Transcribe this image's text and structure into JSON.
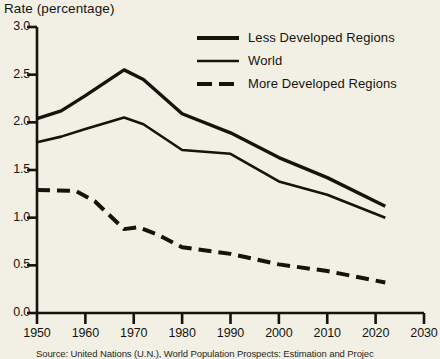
{
  "chart_data": {
    "type": "line",
    "title": "Rate (percentage)",
    "xlabel": "",
    "ylabel": "Rate (percentage)",
    "xlim": [
      1950,
      2030
    ],
    "ylim": [
      0.0,
      3.0
    ],
    "xticks": [
      1950,
      1960,
      1970,
      1980,
      1990,
      2000,
      2010,
      2020,
      2030
    ],
    "yticks": [
      0.0,
      0.5,
      1.0,
      1.5,
      2.0,
      2.5,
      3.0
    ],
    "ytick_labels": [
      "0.0",
      "0.5",
      "1.0",
      "1.5",
      "2.0",
      "2.5",
      "3.0"
    ],
    "xtick_labels": [
      "1950",
      "1960",
      "1970",
      "1980",
      "1990",
      "2000",
      "2010",
      "2020",
      "2030"
    ],
    "grid": false,
    "legend_position": "upper right",
    "series": [
      {
        "name": "Less Developed Regions",
        "style": "solid",
        "color": "#15130d",
        "x": [
          1950,
          1955,
          1960,
          1968,
          1972,
          1980,
          1990,
          2000,
          2010,
          2022
        ],
        "values": [
          2.04,
          2.12,
          2.28,
          2.55,
          2.45,
          2.09,
          1.89,
          1.63,
          1.42,
          1.12
        ]
      },
      {
        "name": "World",
        "style": "solid",
        "color": "#15130d",
        "x": [
          1950,
          1955,
          1960,
          1968,
          1972,
          1980,
          1990,
          2000,
          2010,
          2022
        ],
        "values": [
          1.79,
          1.85,
          1.93,
          2.05,
          1.98,
          1.71,
          1.67,
          1.38,
          1.24,
          1.0
        ]
      },
      {
        "name": "More Developed Regions",
        "style": "dashed",
        "color": "#15130d",
        "x": [
          1950,
          1958,
          1962,
          1968,
          1971,
          1975,
          1980,
          1990,
          2000,
          2010,
          2022
        ],
        "values": [
          1.29,
          1.28,
          1.17,
          0.88,
          0.9,
          0.82,
          0.69,
          0.62,
          0.51,
          0.44,
          0.32
        ]
      }
    ],
    "source": "Source: United Nations (U.N.), World Population Prospects: Estimation and Projec"
  },
  "legend": {
    "items": [
      {
        "label": "Less Developed Regions",
        "swatch": "thick-solid-line-icon"
      },
      {
        "label": "World",
        "swatch": "thin-solid-line-icon"
      },
      {
        "label": "More Developed Regions",
        "swatch": "dashed-line-icon"
      }
    ]
  }
}
